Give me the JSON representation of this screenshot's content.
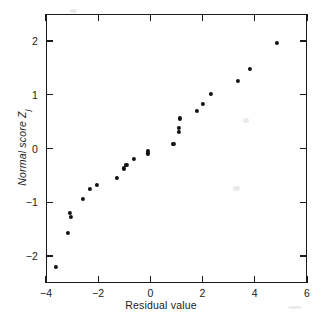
{
  "chart_data": {
    "type": "scatter",
    "title": "",
    "xlabel": "Residual value",
    "ylabel_text": "Normal score Z",
    "ylabel_subscript": "j",
    "xlim": [
      -4,
      6
    ],
    "ylim": [
      -2.5,
      2.5
    ],
    "xticks": [
      -4,
      -2,
      0,
      2,
      4,
      6
    ],
    "xticklabels": [
      "−4",
      "−2",
      "0",
      "2",
      "4",
      "6"
    ],
    "yticks": [
      -2,
      -1,
      0,
      1,
      2
    ],
    "yticklabels": [
      "−2",
      "−1",
      "0",
      "1",
      "2"
    ],
    "grid": false,
    "legend": null,
    "marker": "filled-circle",
    "marker_color": "#111111",
    "frame_color": "#1a1a1a",
    "background_color": "#ffffff",
    "tick_direction": "in",
    "ticks_on_all_sides": true,
    "n_points": 24,
    "points": [
      {
        "x": -3.62,
        "y": -2.2
      },
      {
        "x": -3.15,
        "y": -1.57
      },
      {
        "x": -3.05,
        "y": -1.27
      },
      {
        "x": -3.08,
        "y": -1.2
      },
      {
        "x": -2.58,
        "y": -0.93
      },
      {
        "x": -2.31,
        "y": -0.75
      },
      {
        "x": -2.04,
        "y": -0.67
      },
      {
        "x": -1.27,
        "y": -0.54
      },
      {
        "x": -1.0,
        "y": -0.37
      },
      {
        "x": -0.92,
        "y": -0.31
      },
      {
        "x": -0.62,
        "y": -0.2
      },
      {
        "x": -0.08,
        "y": -0.09
      },
      {
        "x": -0.08,
        "y": -0.04
      },
      {
        "x": 0.88,
        "y": 0.09
      },
      {
        "x": 1.08,
        "y": 0.31
      },
      {
        "x": 1.08,
        "y": 0.38
      },
      {
        "x": 1.12,
        "y": 0.56
      },
      {
        "x": 1.77,
        "y": 0.7
      },
      {
        "x": 2.0,
        "y": 0.83
      },
      {
        "x": 2.31,
        "y": 1.01
      },
      {
        "x": 3.35,
        "y": 1.25
      },
      {
        "x": 3.81,
        "y": 1.48
      },
      {
        "x": 4.85,
        "y": 1.97
      }
    ]
  }
}
